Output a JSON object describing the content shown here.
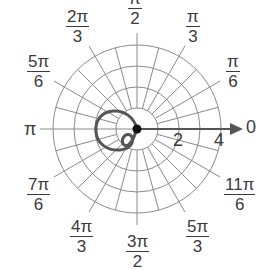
{
  "graph": {
    "type": "polar-grid",
    "center": [
      137,
      129
    ],
    "ring_spacing_px": 21,
    "rings": [
      1,
      2,
      3,
      4
    ],
    "radial_step_deg": 15,
    "grid_color": "#8a8a8a",
    "curve_color": "#555555",
    "axis_color": "#555555",
    "axis_labels": {
      "r2": "2",
      "r4": "4",
      "zero": "0",
      "pi": "π"
    },
    "angle_labels": [
      {
        "id": "pi-over-2",
        "num": "π",
        "den": "2"
      },
      {
        "id": "2pi-over-3",
        "num": "2π",
        "den": "3"
      },
      {
        "id": "pi-over-3",
        "num": "π",
        "den": "3"
      },
      {
        "id": "5pi-over-6",
        "num": "5π",
        "den": "6"
      },
      {
        "id": "pi-over-6",
        "num": "π",
        "den": "6"
      },
      {
        "id": "7pi-over-6",
        "num": "7π",
        "den": "6"
      },
      {
        "id": "11pi-over-6",
        "num": "11π",
        "den": "6"
      },
      {
        "id": "4pi-over-3",
        "num": "4π",
        "den": "3"
      },
      {
        "id": "5pi-over-3",
        "num": "5π",
        "den": "3"
      },
      {
        "id": "3pi-over-2",
        "num": "3π",
        "den": "2"
      }
    ]
  }
}
